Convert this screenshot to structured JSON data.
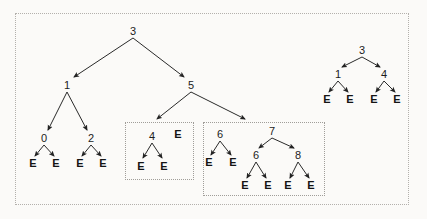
{
  "figure": {
    "background_color": "#fbfaf8",
    "stroke_color": "#2a2a2a",
    "box_border_color": "#a9a6a2",
    "leaf_symbol": "E"
  },
  "boxes": [
    {
      "name": "outer-frame",
      "x": 15,
      "y": 13,
      "w": 394,
      "h": 192,
      "style": "dotted"
    },
    {
      "name": "subtree-group-left",
      "x": 125,
      "y": 122,
      "w": 69,
      "h": 58,
      "style": "dotted"
    },
    {
      "name": "subtree-group-right",
      "x": 203,
      "y": 122,
      "w": 122,
      "h": 74,
      "style": "dotted"
    }
  ],
  "trees": {
    "main": {
      "nodes": [
        {
          "id": "m-root",
          "label": "3",
          "x": 133,
          "y": 31,
          "kind": "internal"
        },
        {
          "id": "m-1",
          "label": "1",
          "x": 67,
          "y": 85,
          "kind": "internal"
        },
        {
          "id": "m-5",
          "label": "5",
          "x": 191,
          "y": 85,
          "kind": "internal"
        },
        {
          "id": "m-0",
          "label": "0",
          "x": 44,
          "y": 138,
          "kind": "internal"
        },
        {
          "id": "m-2",
          "label": "2",
          "x": 91,
          "y": 138,
          "kind": "internal"
        },
        {
          "id": "m-0-l",
          "label": "E",
          "x": 33,
          "y": 163,
          "kind": "leaf"
        },
        {
          "id": "m-0-r",
          "label": "E",
          "x": 56,
          "y": 163,
          "kind": "leaf"
        },
        {
          "id": "m-2-l",
          "label": "E",
          "x": 80,
          "y": 163,
          "kind": "leaf"
        },
        {
          "id": "m-2-r",
          "label": "E",
          "x": 103,
          "y": 163,
          "kind": "leaf"
        }
      ],
      "edges": [
        {
          "from": "m-root",
          "to": "m-1",
          "x1": 133,
          "y1": 38,
          "x2": 74,
          "y2": 77
        },
        {
          "from": "m-root",
          "to": "m-5",
          "x1": 133,
          "y1": 38,
          "x2": 184,
          "y2": 77
        },
        {
          "from": "m-1",
          "to": "m-0",
          "x1": 67,
          "y1": 92,
          "x2": 48,
          "y2": 130
        },
        {
          "from": "m-1",
          "to": "m-2",
          "x1": 67,
          "y1": 92,
          "x2": 87,
          "y2": 130
        },
        {
          "from": "m-0",
          "to": "m-0-l",
          "x1": 44,
          "y1": 145,
          "x2": 35,
          "y2": 156
        },
        {
          "from": "m-0",
          "to": "m-0-r",
          "x1": 44,
          "y1": 145,
          "x2": 54,
          "y2": 156
        },
        {
          "from": "m-2",
          "to": "m-2-l",
          "x1": 91,
          "y1": 145,
          "x2": 82,
          "y2": 156
        },
        {
          "from": "m-2",
          "to": "m-2-r",
          "x1": 91,
          "y1": 145,
          "x2": 101,
          "y2": 156
        },
        {
          "from": "m-5",
          "to": "group-left",
          "x1": 191,
          "y1": 92,
          "x2": 157,
          "y2": 119
        },
        {
          "from": "m-5",
          "to": "group-right",
          "x1": 191,
          "y1": 92,
          "x2": 245,
          "y2": 119
        }
      ]
    },
    "group_left": {
      "nodes": [
        {
          "id": "gl-4",
          "label": "4",
          "x": 152,
          "y": 136,
          "kind": "internal"
        },
        {
          "id": "gl-4-l",
          "label": "E",
          "x": 141,
          "y": 166,
          "kind": "leaf"
        },
        {
          "id": "gl-4-r",
          "label": "E",
          "x": 164,
          "y": 166,
          "kind": "leaf"
        },
        {
          "id": "gl-e",
          "label": "E",
          "x": 178,
          "y": 134,
          "kind": "leaf"
        }
      ],
      "edges": [
        {
          "from": "gl-4",
          "to": "gl-4-l",
          "x1": 152,
          "y1": 143,
          "x2": 143,
          "y2": 158
        },
        {
          "from": "gl-4",
          "to": "gl-4-r",
          "x1": 152,
          "y1": 143,
          "x2": 162,
          "y2": 158
        }
      ]
    },
    "group_right": {
      "nodes": [
        {
          "id": "gr-6",
          "label": "6",
          "x": 220,
          "y": 134,
          "kind": "internal"
        },
        {
          "id": "gr-6-l",
          "label": "E",
          "x": 209,
          "y": 162,
          "kind": "leaf"
        },
        {
          "id": "gr-6-r",
          "label": "E",
          "x": 233,
          "y": 162,
          "kind": "leaf"
        },
        {
          "id": "gr-7",
          "label": "7",
          "x": 272,
          "y": 131,
          "kind": "internal"
        },
        {
          "id": "gr-7-6",
          "label": "6",
          "x": 256,
          "y": 155,
          "kind": "internal"
        },
        {
          "id": "gr-7-8",
          "label": "8",
          "x": 298,
          "y": 155,
          "kind": "internal"
        },
        {
          "id": "gr-7-6-l",
          "label": "E",
          "x": 245,
          "y": 185,
          "kind": "leaf"
        },
        {
          "id": "gr-7-6-r",
          "label": "E",
          "x": 268,
          "y": 185,
          "kind": "leaf"
        },
        {
          "id": "gr-7-8-l",
          "label": "E",
          "x": 288,
          "y": 185,
          "kind": "leaf"
        },
        {
          "id": "gr-7-8-r",
          "label": "E",
          "x": 311,
          "y": 185,
          "kind": "leaf"
        }
      ],
      "edges": [
        {
          "from": "gr-6",
          "to": "gr-6-l",
          "x1": 220,
          "y1": 141,
          "x2": 211,
          "y2": 155
        },
        {
          "from": "gr-6",
          "to": "gr-6-r",
          "x1": 220,
          "y1": 141,
          "x2": 231,
          "y2": 155
        },
        {
          "from": "gr-7",
          "to": "gr-7-6",
          "x1": 272,
          "y1": 138,
          "x2": 259,
          "y2": 148
        },
        {
          "from": "gr-7",
          "to": "gr-7-8",
          "x1": 272,
          "y1": 138,
          "x2": 294,
          "y2": 148
        },
        {
          "from": "gr-7-6",
          "to": "gr-7-6-l",
          "x1": 256,
          "y1": 162,
          "x2": 247,
          "y2": 178
        },
        {
          "from": "gr-7-6",
          "to": "gr-7-6-r",
          "x1": 256,
          "y1": 162,
          "x2": 266,
          "y2": 178
        },
        {
          "from": "gr-7-8",
          "to": "gr-7-8-l",
          "x1": 298,
          "y1": 162,
          "x2": 290,
          "y2": 178
        },
        {
          "from": "gr-7-8",
          "to": "gr-7-8-r",
          "x1": 298,
          "y1": 162,
          "x2": 309,
          "y2": 178
        }
      ]
    },
    "right": {
      "nodes": [
        {
          "id": "r-3",
          "label": "3",
          "x": 362,
          "y": 50,
          "kind": "internal"
        },
        {
          "id": "r-1",
          "label": "1",
          "x": 338,
          "y": 74,
          "kind": "internal"
        },
        {
          "id": "r-4",
          "label": "4",
          "x": 384,
          "y": 74,
          "kind": "internal"
        },
        {
          "id": "r-1-l",
          "label": "E",
          "x": 327,
          "y": 99,
          "kind": "leaf"
        },
        {
          "id": "r-1-r",
          "label": "E",
          "x": 350,
          "y": 99,
          "kind": "leaf"
        },
        {
          "id": "r-4-l",
          "label": "E",
          "x": 374,
          "y": 99,
          "kind": "leaf"
        },
        {
          "id": "r-4-r",
          "label": "E",
          "x": 397,
          "y": 99,
          "kind": "leaf"
        }
      ],
      "edges": [
        {
          "from": "r-3",
          "to": "r-1",
          "x1": 362,
          "y1": 57,
          "x2": 342,
          "y2": 67
        },
        {
          "from": "r-3",
          "to": "r-4",
          "x1": 362,
          "y1": 57,
          "x2": 380,
          "y2": 67
        },
        {
          "from": "r-1",
          "to": "r-1-l",
          "x1": 338,
          "y1": 81,
          "x2": 329,
          "y2": 92
        },
        {
          "from": "r-1",
          "to": "r-1-r",
          "x1": 338,
          "y1": 81,
          "x2": 348,
          "y2": 92
        },
        {
          "from": "r-4",
          "to": "r-4-l",
          "x1": 384,
          "y1": 81,
          "x2": 376,
          "y2": 92
        },
        {
          "from": "r-4",
          "to": "r-4-r",
          "x1": 384,
          "y1": 81,
          "x2": 395,
          "y2": 92
        }
      ]
    }
  }
}
